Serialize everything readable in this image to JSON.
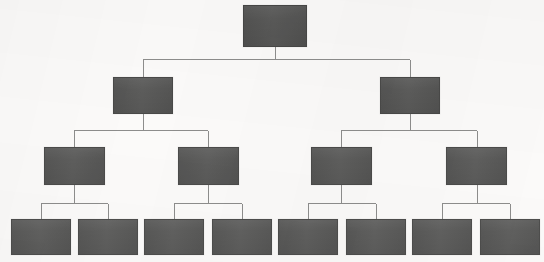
{
  "diagram": {
    "type": "binary-tree",
    "levels": 4,
    "node_count": 15,
    "background_color": "#fbfaf9",
    "node_fill_color": "#585857",
    "node_border_color": "#4a4a49",
    "connector_color": "#8d8d8c",
    "canvas": {
      "width": 544,
      "height": 262
    },
    "note": "All node labels are illegible / redacted in the source scan; nodes render as solid filled rectangles."
  },
  "nodes": [
    {
      "id": "n1",
      "label": "",
      "level": 1,
      "x": 243,
      "y": 5,
      "w": 64,
      "h": 42
    },
    {
      "id": "n2",
      "label": "",
      "level": 2,
      "x": 113,
      "y": 77,
      "w": 60,
      "h": 37
    },
    {
      "id": "n3",
      "label": "",
      "level": 2,
      "x": 380,
      "y": 77,
      "w": 60,
      "h": 37
    },
    {
      "id": "n4",
      "label": "",
      "level": 3,
      "x": 44,
      "y": 147,
      "w": 61,
      "h": 38
    },
    {
      "id": "n5",
      "label": "",
      "level": 3,
      "x": 178,
      "y": 147,
      "w": 61,
      "h": 38
    },
    {
      "id": "n6",
      "label": "",
      "level": 3,
      "x": 311,
      "y": 147,
      "w": 61,
      "h": 38
    },
    {
      "id": "n7",
      "label": "",
      "level": 3,
      "x": 446,
      "y": 147,
      "w": 61,
      "h": 38
    },
    {
      "id": "n8",
      "label": "",
      "level": 4,
      "x": 11,
      "y": 219,
      "w": 60,
      "h": 36
    },
    {
      "id": "n9",
      "label": "",
      "level": 4,
      "x": 78,
      "y": 219,
      "w": 60,
      "h": 36
    },
    {
      "id": "n10",
      "label": "",
      "level": 4,
      "x": 144,
      "y": 219,
      "w": 60,
      "h": 36
    },
    {
      "id": "n11",
      "label": "",
      "level": 4,
      "x": 212,
      "y": 219,
      "w": 60,
      "h": 36
    },
    {
      "id": "n12",
      "label": "",
      "level": 4,
      "x": 278,
      "y": 219,
      "w": 60,
      "h": 36
    },
    {
      "id": "n13",
      "label": "",
      "level": 4,
      "x": 346,
      "y": 219,
      "w": 60,
      "h": 36
    },
    {
      "id": "n14",
      "label": "",
      "level": 4,
      "x": 412,
      "y": 219,
      "w": 60,
      "h": 36
    },
    {
      "id": "n15",
      "label": "",
      "level": 4,
      "x": 480,
      "y": 219,
      "w": 60,
      "h": 36
    }
  ],
  "connectors": [
    {
      "from": "n1",
      "to": [
        "n2",
        "n3"
      ],
      "stem_x": 275,
      "stem_top": 47,
      "bus_y": 59,
      "bus_x1": 143,
      "bus_x2": 410,
      "drop_xs": [
        143,
        410
      ],
      "drop_bottom": 77
    },
    {
      "from": "n2",
      "to": [
        "n4",
        "n5"
      ],
      "stem_x": 143,
      "stem_top": 114,
      "bus_y": 130,
      "bus_x1": 74,
      "bus_x2": 208,
      "drop_xs": [
        74,
        208
      ],
      "drop_bottom": 147
    },
    {
      "from": "n3",
      "to": [
        "n6",
        "n7"
      ],
      "stem_x": 410,
      "stem_top": 114,
      "bus_y": 130,
      "bus_x1": 341,
      "bus_x2": 477,
      "drop_xs": [
        341,
        477
      ],
      "drop_bottom": 147
    },
    {
      "from": "n4",
      "to": [
        "n8",
        "n9"
      ],
      "stem_x": 74,
      "stem_top": 185,
      "bus_y": 203,
      "bus_x1": 41,
      "bus_x2": 108,
      "drop_xs": [
        41,
        108
      ],
      "drop_bottom": 219
    },
    {
      "from": "n5",
      "to": [
        "n10",
        "n11"
      ],
      "stem_x": 208,
      "stem_top": 185,
      "bus_y": 203,
      "bus_x1": 174,
      "bus_x2": 242,
      "drop_xs": [
        174,
        242
      ],
      "drop_bottom": 219
    },
    {
      "from": "n6",
      "to": [
        "n12",
        "n13"
      ],
      "stem_x": 341,
      "stem_top": 185,
      "bus_y": 203,
      "bus_x1": 308,
      "bus_x2": 376,
      "drop_xs": [
        308,
        376
      ],
      "drop_bottom": 219
    },
    {
      "from": "n7",
      "to": [
        "n14",
        "n15"
      ],
      "stem_x": 477,
      "stem_top": 185,
      "bus_y": 203,
      "bus_x1": 442,
      "bus_x2": 510,
      "drop_xs": [
        442,
        510
      ],
      "drop_bottom": 219
    }
  ]
}
